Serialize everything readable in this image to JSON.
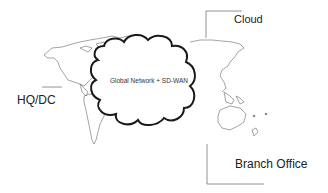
{
  "diagram": {
    "cloud_center_label": "Global Network + SD-WAN",
    "nodes": [
      {
        "id": "cloud",
        "label": "Cloud"
      },
      {
        "id": "hq",
        "label": "HQ/DC"
      },
      {
        "id": "branch",
        "label": "Branch Office"
      }
    ],
    "colors": {
      "cloud_outline": "#1a1a1a",
      "map_outline": "#555555",
      "connector": "#666666",
      "text": "#222222"
    }
  }
}
